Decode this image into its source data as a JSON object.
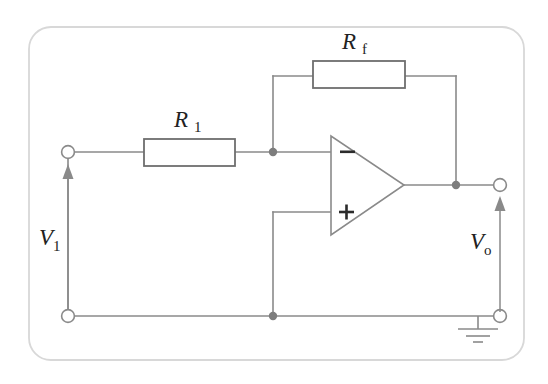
{
  "figure": {
    "background_color": "#ffffff",
    "panel_border_color": "#d8d8d8",
    "wire_color": "#8a8a8a",
    "component_outline_color": "#6e6e6e",
    "node_color": "#7d7d7d",
    "text_color": "#222222"
  },
  "labels": {
    "resistor_feedback": {
      "symbol": "R",
      "subscript": "f"
    },
    "resistor_input": {
      "symbol": "R",
      "subscript": "1"
    },
    "voltage_input": {
      "symbol": "V",
      "subscript": "1"
    },
    "voltage_output": {
      "symbol": "V",
      "subscript": "o"
    }
  },
  "opamp": {
    "inverting_input_sign": "−",
    "noninverting_input_sign": "+"
  },
  "components": {
    "ground_symbol": "earth-ground",
    "terminal_count": 4,
    "node_count": 3
  }
}
